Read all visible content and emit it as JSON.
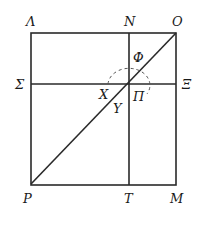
{
  "diagram": {
    "type": "geometric-square-with-diagonal",
    "labels": {
      "top_left": "Λ",
      "top_mid": "N",
      "top_right": "O",
      "mid_left": "Σ",
      "mid_right": "Ξ",
      "bottom_left": "P",
      "bottom_mid": "T",
      "bottom_right": "M",
      "arc_top": "Φ",
      "center_left": "X",
      "center_right": "Π",
      "center_below": "Υ"
    },
    "colors": {
      "line": "#2a2a2a",
      "text": "#1a1a1a",
      "background": "#ffffff"
    }
  }
}
